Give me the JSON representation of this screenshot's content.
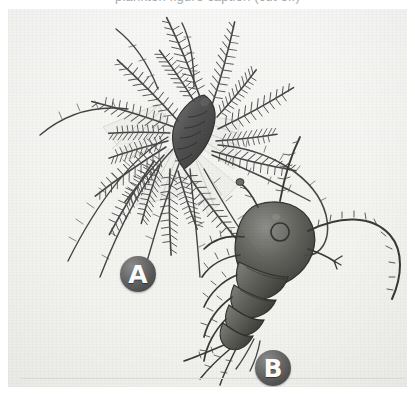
{
  "figure": {
    "caption_cutoff": "plankton figure caption (cut off)",
    "background_color": "#f4f4f1",
    "page_color": "#ffffff",
    "ink_color": "#3a3a3a",
    "badge_color": "#565656",
    "badge_text_color": "#fbfbfb",
    "rule_color": "#d9d9d6"
  },
  "labels": [
    {
      "id": "a",
      "text": "A",
      "name": "label-badge-a",
      "subject": "feathery plumose plankton specimen with radiating setae"
    },
    {
      "id": "b",
      "text": "B",
      "name": "label-badge-b",
      "subject": "segmented copepod specimen with antennae and swimming legs"
    }
  ],
  "specimens": [
    {
      "id": "a",
      "common_name": "plumose plankton specimen",
      "description": "dark elongated segmented body at centre with long branching plumose setae radiating outward",
      "position": "upper left"
    },
    {
      "id": "b",
      "common_name": "segmented copepod specimen",
      "description": "rounded dark head shield, banded segmented abdomen, one long curved antenna to the right and paired thoracic legs",
      "position": "lower right"
    }
  ]
}
